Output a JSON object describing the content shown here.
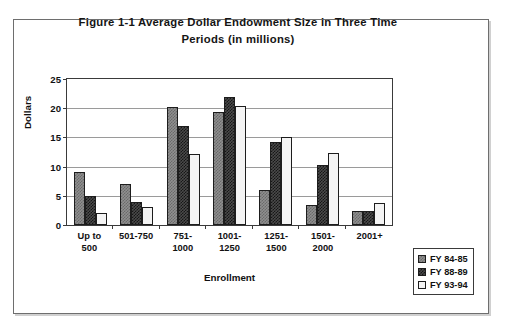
{
  "figure": {
    "title_line1": "Figure 1-1 Average Dollar Endowment Size in Three Time",
    "title_line2": "Periods (in millions)"
  },
  "chart_data": {
    "type": "bar",
    "title": "Figure 1-1 Average Dollar Endowment Size in Three Time Periods (in millions)",
    "xlabel": "Enrollment",
    "ylabel": "Dollars",
    "ylim": [
      0,
      25
    ],
    "ytick_labels": [
      "0",
      "5",
      "10",
      "15",
      "20",
      "25"
    ],
    "ytick_values": [
      0,
      5,
      10,
      15,
      20,
      25
    ],
    "grid": true,
    "legend_position": "right-bottom-outside",
    "categories": [
      "Up to 500",
      "501-750",
      "751-1000",
      "1001-1250",
      "1251-1500",
      "1501-2000",
      "2001+"
    ],
    "category_lines": [
      [
        "Up to",
        "500"
      ],
      [
        "501-750",
        ""
      ],
      [
        "751-",
        "1000"
      ],
      [
        "1001-",
        "1250"
      ],
      [
        "1251-",
        "1500"
      ],
      [
        "1501-",
        "2000"
      ],
      [
        "2001+",
        ""
      ]
    ],
    "series": [
      {
        "name": "FY 84-85",
        "color": "#8f8f8f",
        "pattern": "checker-medium",
        "values": [
          9.0,
          7.1,
          20.2,
          19.3,
          6.0,
          3.5,
          2.4
        ]
      },
      {
        "name": "FY 88-89",
        "color": "#4a4a4a",
        "pattern": "checker-dark",
        "values": [
          5.0,
          4.0,
          17.0,
          22.0,
          14.3,
          10.3,
          2.4
        ]
      },
      {
        "name": "FY 93-94",
        "color": "#f4f4f4",
        "pattern": "solid-white",
        "values": [
          2.0,
          3.0,
          12.1,
          20.3,
          15.0,
          12.3,
          3.7
        ]
      }
    ]
  },
  "legend": {
    "items": [
      {
        "label": "FY 84-85"
      },
      {
        "label": "FY 88-89"
      },
      {
        "label": "FY 93-94"
      }
    ]
  }
}
